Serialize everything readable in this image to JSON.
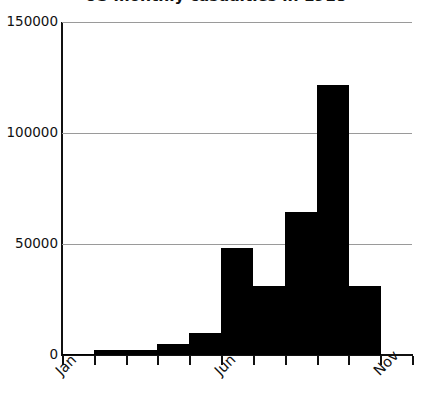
{
  "chart_data": {
    "type": "bar",
    "title": "US monthly casualties in 1918",
    "xlabel": "",
    "ylabel": "",
    "categories": [
      "Jan",
      "Feb",
      "Mar",
      "Apr",
      "May",
      "Jun",
      "Jul",
      "Aug",
      "Sep",
      "Oct"
    ],
    "values": [
      500,
      2200,
      2200,
      5000,
      10000,
      48000,
      31000,
      64500,
      121500,
      31000
    ],
    "ylim": [
      0,
      150000
    ],
    "ytick_labels": [
      "150000",
      "100000",
      "50000",
      "0"
    ],
    "ytick_values": [
      150000,
      100000,
      50000,
      0
    ],
    "xtick_labels": [
      "Jan",
      "Jun",
      "Nov"
    ],
    "xtick_label_indices": [
      0,
      5,
      10
    ],
    "xtick_count": 12,
    "grid": true,
    "legend": null,
    "bar_color": "#000000",
    "grid_color": "#9a9a9a",
    "axis_color": "#111111",
    "background": "#ffffff"
  }
}
